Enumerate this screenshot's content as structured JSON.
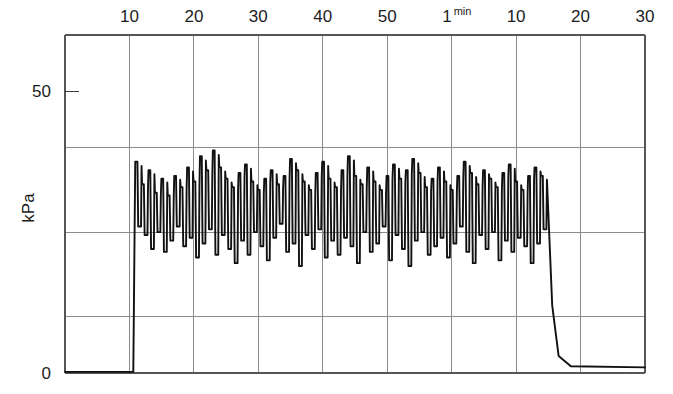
{
  "figure": {
    "background": "#ffffff",
    "trace_color": "#111111",
    "grid_color": "#8b8b8b",
    "frame_color": "#555555"
  },
  "chart_data": {
    "type": "line",
    "title": "",
    "subtitle": "",
    "xlabel": "",
    "ylabel": "kPa",
    "grid": true,
    "legend": null,
    "annotations": [],
    "xlim": [
      0,
      90
    ],
    "ylim": [
      0,
      60
    ],
    "y_axis": {
      "unit": "kPa",
      "tick_values": [
        0,
        50
      ],
      "tick_labels": [
        "0",
        "50"
      ],
      "gridline_values": [
        10,
        20,
        30,
        40
      ],
      "gridlines_drawn_at": [
        10,
        25,
        40
      ]
    },
    "x_axis": {
      "unit": "s",
      "tick_values": [
        10,
        20,
        30,
        40,
        50,
        60,
        70,
        80,
        90
      ],
      "tick_labels": [
        "10",
        "20",
        "30",
        "40",
        "50",
        "1",
        "10",
        "20",
        "30"
      ],
      "tick_superscripts": [
        "",
        "",
        "",
        "",
        "",
        "min",
        "",
        "",
        ""
      ]
    },
    "segments": [
      {
        "name": "baseline-before",
        "x": [
          0,
          10.6
        ],
        "y": [
          0.2,
          0.2
        ]
      },
      {
        "name": "onset-rise",
        "x": [
          10.6,
          10.9
        ],
        "y": [
          0.2,
          37.5
        ]
      },
      {
        "name": "offset-fall",
        "x": [
          74.8,
          75.6,
          76.6,
          78.5
        ],
        "y": [
          34.0,
          12.0,
          3.0,
          1.2
        ]
      },
      {
        "name": "baseline-after",
        "x": [
          78.5,
          90
        ],
        "y": [
          1.2,
          1.0
        ]
      }
    ],
    "oscillation": {
      "name": "pressure-oscillation-plateau",
      "x_start": 10.9,
      "x_end": 74.8,
      "cycle_count": 64,
      "peak_mean": 34.5,
      "trough_mean": 22.5,
      "peaks": [
        37.5,
        33.5,
        36.0,
        32.0,
        34.5,
        31.5,
        35.0,
        33.0,
        36.5,
        34.0,
        38.5,
        36.0,
        39.5,
        36.5,
        34.5,
        33.0,
        35.5,
        37.0,
        34.0,
        32.5,
        34.5,
        36.0,
        33.5,
        35.0,
        38.0,
        36.0,
        34.0,
        32.5,
        35.5,
        37.5,
        34.5,
        33.0,
        36.0,
        38.5,
        35.0,
        33.5,
        36.5,
        34.0,
        32.5,
        35.0,
        37.0,
        34.5,
        36.0,
        38.0,
        35.5,
        33.0,
        34.5,
        36.5,
        34.0,
        32.5,
        35.0,
        37.5,
        35.5,
        33.5,
        36.0,
        34.5,
        33.0,
        35.5,
        37.0,
        34.0,
        32.5,
        35.0,
        36.5,
        35.0
      ],
      "troughs": [
        26.0,
        24.5,
        22.0,
        25.0,
        21.5,
        23.5,
        26.0,
        22.5,
        24.0,
        20.5,
        23.0,
        25.5,
        21.0,
        24.5,
        22.0,
        19.5,
        23.5,
        21.0,
        25.0,
        22.5,
        20.0,
        24.0,
        26.5,
        21.5,
        23.0,
        19.0,
        24.5,
        22.0,
        25.5,
        20.5,
        23.5,
        21.0,
        24.0,
        22.5,
        19.5,
        25.0,
        21.5,
        23.0,
        26.0,
        20.0,
        24.5,
        22.0,
        19.0,
        23.5,
        25.0,
        21.0,
        22.5,
        24.0,
        20.5,
        23.0,
        26.0,
        21.5,
        19.5,
        24.5,
        22.0,
        25.0,
        20.0,
        23.5,
        21.5,
        24.0,
        22.5,
        19.5,
        23.0,
        25.5
      ]
    }
  }
}
